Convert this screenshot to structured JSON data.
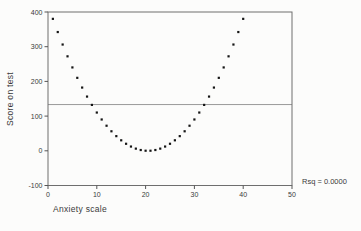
{
  "chart_data": {
    "type": "scatter",
    "title": "",
    "xlabel": "Anxiety scale",
    "ylabel": "Score on test",
    "xlim": [
      0,
      50
    ],
    "ylim": [
      -100,
      400
    ],
    "x_ticks": [
      0,
      10,
      20,
      30,
      40,
      50
    ],
    "y_ticks": [
      400,
      300,
      200,
      100,
      0,
      -100
    ],
    "grid": false,
    "legend": "none",
    "marker": "small-black-square",
    "reference_line_y": 133.25,
    "annotation": "Rsq = 0.0000",
    "annotation_position": "right-of-plot-bottom",
    "x": [
      1,
      2,
      3,
      4,
      5,
      6,
      7,
      8,
      9,
      10,
      11,
      12,
      13,
      14,
      15,
      16,
      17,
      18,
      19,
      20,
      21,
      22,
      23,
      24,
      25,
      26,
      27,
      28,
      29,
      30,
      31,
      32,
      33,
      34,
      35,
      36,
      37,
      38,
      39,
      40
    ],
    "y": [
      380.25,
      342.25,
      306.25,
      272.25,
      240.25,
      210.25,
      182.25,
      156.25,
      132.25,
      110.25,
      90.25,
      72.25,
      56.25,
      42.25,
      30.25,
      20.25,
      12.25,
      6.25,
      2.25,
      0.25,
      0.25,
      2.25,
      6.25,
      12.25,
      20.25,
      30.25,
      42.25,
      56.25,
      72.25,
      90.25,
      110.25,
      132.25,
      156.25,
      182.25,
      210.25,
      240.25,
      272.25,
      306.25,
      342.25,
      380.25
    ]
  },
  "colors": {
    "frame": "#6e6e6e",
    "tick": "#555555",
    "reference_line": "#9a9a9a",
    "marker": "#151515",
    "text": "#3a3a3a",
    "background": "#fcfcfb"
  }
}
